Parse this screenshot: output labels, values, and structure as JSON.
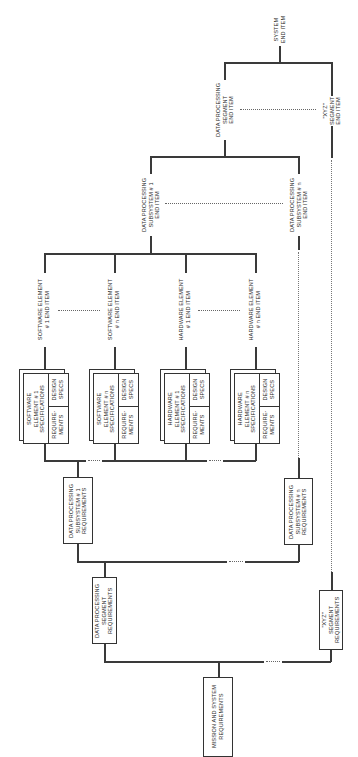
{
  "end_items": {
    "system": [
      "SYSTEM",
      "END ITEM"
    ],
    "dp_segment": [
      "DATA PROCESSING",
      "SEGMENT",
      "END ITEM"
    ],
    "xyz_segment": [
      "\"XYZ\"",
      "SEGMENT",
      "END ITEM"
    ],
    "dp_subsystem_1": [
      "DATA PROCESSING",
      "SUBSYSTEM # 1",
      "END ITEM"
    ],
    "dp_subsystem_n": [
      "DATA PROCESSING",
      "SUBSYSTEM # n",
      "END ITEM"
    ],
    "sw_element_1": [
      "SOFTWARE ELEMENT",
      "# 1 END ITEM"
    ],
    "sw_element_n": [
      "SOFTWARE ELEMENT",
      "# n END ITEM"
    ],
    "hw_element_1": [
      "HARDWARE ELEMENT",
      "# 1 END ITEM"
    ],
    "hw_element_n": [
      "HARDWARE ELEMENT",
      "# n END ITEM"
    ]
  },
  "spec_boxes": [
    {
      "title": [
        "SOFTWARE",
        "ELEMENT # 1",
        "SPECIFICATIONS"
      ],
      "design": [
        "DESIGN",
        "SPECS"
      ],
      "req": [
        "REQUIRE-",
        "MENTS"
      ]
    },
    {
      "title": [
        "SOFTWARE",
        "ELEMENT # n",
        "SPECIFICATIONS"
      ],
      "design": [
        "DESIGN",
        "SPECS"
      ],
      "req": [
        "REQUIRE-",
        "MENTS"
      ]
    },
    {
      "title": [
        "HARDWARE",
        "ELEMENT # 1",
        "SPECIFICATIONS"
      ],
      "design": [
        "DESIGN",
        "SPECS"
      ],
      "req": [
        "REQUIRE-",
        "MENTS"
      ]
    },
    {
      "title": [
        "HARDWARE",
        "ELEMENT # n",
        "SPECIFICATIONS"
      ],
      "design": [
        "DESIGN",
        "SPECS"
      ],
      "req": [
        "REQUIRE-",
        "MENTS"
      ]
    }
  ],
  "requirements": {
    "dp_subsystem_1": [
      "DATA PROCESSING",
      "SUBSYSTEM # 1",
      "REQUIREMENTS"
    ],
    "dp_subsystem_n": [
      "DATA PROCESSING",
      "SUBSYSTEM # n",
      "REQUIREMENTS"
    ],
    "dp_segment": [
      "DATA PROCESSING",
      "SEGMENT",
      "REQUIREMENTS"
    ],
    "xyz_segment": [
      "\"XYZ\"",
      "SEGMENT",
      "REQUIREMENTS"
    ],
    "mission": [
      "MISSION AND SYSTEM",
      "REQUIREMENTS"
    ]
  },
  "ellipsis": "· · · ·"
}
